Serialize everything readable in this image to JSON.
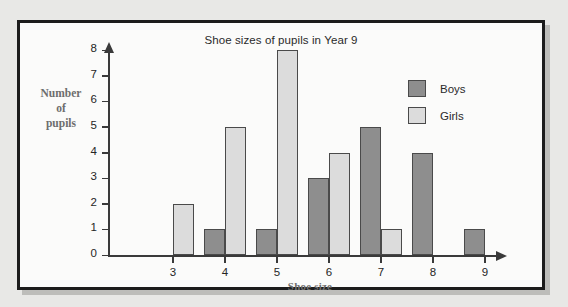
{
  "chart_data": {
    "type": "bar",
    "title": "Shoe sizes of pupils in Year 9",
    "xlabel": "Shoe size",
    "ylabel": "Number of pupils",
    "ylabel_lines": [
      "Number",
      "of",
      "pupils"
    ],
    "categories": [
      "3",
      "4",
      "5",
      "6",
      "7",
      "8",
      "9"
    ],
    "series": [
      {
        "name": "Boys",
        "color": "#8e8e8e",
        "values": [
          0,
          1,
          1,
          3,
          5,
          4,
          1
        ]
      },
      {
        "name": "Girls",
        "color": "#dcdcdc",
        "values": [
          2,
          5,
          8,
          4,
          1,
          0,
          0
        ]
      }
    ],
    "ylim": [
      0,
      8
    ],
    "yticks": [
      "8",
      "7",
      "6",
      "5",
      "4",
      "3",
      "2",
      "1",
      "0"
    ],
    "grid": false,
    "legend_position": "top-right"
  }
}
